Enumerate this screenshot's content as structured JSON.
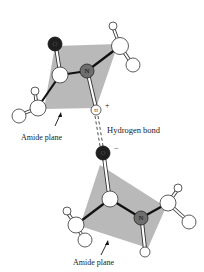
{
  "figure": {
    "colors": {
      "plane": "#b9b9b9",
      "oxygen": "#1f1f1f",
      "nitrogen": "#6e6e6e",
      "white_atom": "#ffffff",
      "bond_dark": "#111111",
      "outline": "#333333"
    }
  },
  "labels": {
    "amide_plane_top": "Amide plane",
    "amide_plane_bottom": "Amide plane",
    "hydrogen_bond": "Hydrogen bond",
    "partial_positive": "+",
    "partial_negative": "−"
  },
  "atoms": {
    "top": {
      "oxygen": "O",
      "nitrogen": "N",
      "hydrogen": "H"
    },
    "bottom": {
      "oxygen": "O",
      "nitrogen": "N"
    }
  }
}
